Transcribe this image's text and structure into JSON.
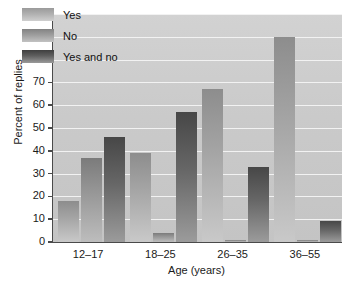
{
  "chart_data": {
    "type": "bar",
    "title": "",
    "subtitle": "",
    "xlabel": "Age (years)",
    "ylabel": "Percent of replies",
    "categories": [
      "12–17",
      "18–25",
      "26–35",
      "36–55"
    ],
    "series": [
      {
        "name": "Yes",
        "values": [
          18,
          39,
          67,
          90
        ]
      },
      {
        "name": "No",
        "values": [
          37,
          4,
          1,
          1
        ]
      },
      {
        "name": "Yes and no",
        "values": [
          46,
          57,
          33,
          9
        ]
      }
    ],
    "ylim": [
      0,
      100
    ],
    "ytick_step": 10,
    "yticks": [
      0,
      10,
      20,
      30,
      40,
      50,
      60,
      70,
      80,
      90,
      100
    ],
    "grid": true,
    "grid_axis": "y",
    "legend_position": "top-left-inside",
    "colors": {
      "series_yes_top": "#8d8d8d",
      "series_yes_bottom": "#c9c9c9",
      "series_no_top": "#7b7b7b",
      "series_no_bottom": "#bdbdbd",
      "series_yesno_top": "#474747",
      "series_yesno_bottom": "#9b9b9b",
      "plot_background": "#cacaca",
      "gridline": "#f2f2f2",
      "axis": "#4a4a4a",
      "text": "#1a1a1a",
      "figure_background": "#ffffff"
    }
  }
}
